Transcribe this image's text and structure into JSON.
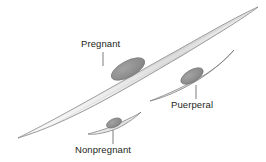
{
  "figure": {
    "background_color": "#ffffff"
  },
  "labels": {
    "pregnant": "Pregnant",
    "puerperal": "Puerperal",
    "nonpregnant": "Nonpregnant"
  },
  "colors": {
    "cell_fill_light": "#f2f2f2",
    "cell_fill_mid": "#d9d9d9",
    "cell_outline": "#6e6e6e",
    "nucleus_fill": "#8e8e8e",
    "nucleus_outline": "#6a6a6a",
    "striation": "#bdbdbd",
    "leader_line": "#6e6e6e",
    "text": "#231f20"
  },
  "diagram_data": {
    "type": "diagram",
    "subject": "uterine smooth muscle cells at three physiological states",
    "cells": [
      {
        "name": "pregnant",
        "label": "Pregnant",
        "relative_size": "largest",
        "tip_start": [
          18,
          138
        ],
        "tip_end": [
          258,
          7
        ],
        "nucleus_center": [
          128,
          69
        ],
        "leader_line": {
          "x": 103,
          "y1": 52,
          "y2": 66
        }
      },
      {
        "name": "puerperal",
        "label": "Puerperal",
        "relative_size": "medium",
        "tip_start": [
          150,
          101
        ],
        "tip_end": [
          234,
          50
        ],
        "nucleus_center": [
          192,
          76
        ],
        "leader_line": {
          "x": 196,
          "y1": 85,
          "y2": 99
        }
      },
      {
        "name": "nonpregnant",
        "label": "Nonpregnant",
        "relative_size": "smallest",
        "tip_start": [
          88,
          134
        ],
        "tip_end": [
          141,
          112
        ],
        "nucleus_center": [
          114,
          123
        ],
        "leader_line": {
          "x": 113,
          "y1": 130,
          "y2": 144
        }
      }
    ]
  }
}
